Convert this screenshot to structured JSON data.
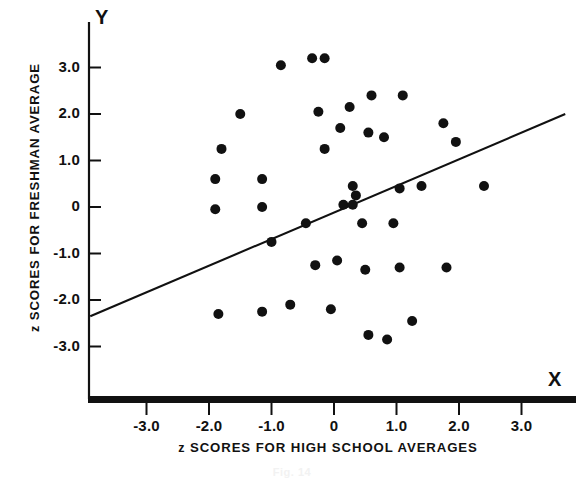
{
  "figure": {
    "caption": "Fig. 14",
    "axis_letters": {
      "y": "Y",
      "x": "X"
    },
    "ink_color": "#111111",
    "background_color": "#ffffff"
  },
  "chart_data": {
    "type": "scatter",
    "title": "",
    "xlabel": "z SCORES FOR HIGH SCHOOL AVERAGES",
    "ylabel": "z SCORES FOR FRESHMAN AVERAGE",
    "xlabel_prefix": "z",
    "xlabel_rest": "SCORES FOR HIGH SCHOOL AVERAGES",
    "ylabel_prefix": "z",
    "ylabel_rest": "SCORES FOR FRESHMAN AVERAGE",
    "grid": false,
    "legend": "none",
    "xlim": [
      -3.95,
      3.85
    ],
    "ylim": [
      -4.0,
      3.75
    ],
    "xticks": [
      -3.0,
      -2.0,
      -1.0,
      0,
      1.0,
      2.0,
      3.0
    ],
    "xtick_labels": [
      "-3.0",
      "-2.0",
      "-1.0",
      "0",
      "1.0",
      "2.0",
      "3.0"
    ],
    "yticks": [
      3.0,
      2.0,
      1.0,
      0,
      -1.0,
      -2.0,
      -3.0
    ],
    "ytick_labels": [
      "3.0",
      "2.0",
      "1.0",
      "0",
      "-1.0",
      "-2.0",
      "-3.0"
    ],
    "point_marker": "filled-circle",
    "point_radius_px": 5,
    "n_points": 42,
    "points": [
      {
        "x": -0.85,
        "y": 3.05
      },
      {
        "x": -0.35,
        "y": 3.2
      },
      {
        "x": -0.15,
        "y": 3.2
      },
      {
        "x": 0.6,
        "y": 2.4
      },
      {
        "x": 1.1,
        "y": 2.4
      },
      {
        "x": -1.5,
        "y": 2.0
      },
      {
        "x": -0.25,
        "y": 2.05
      },
      {
        "x": 0.25,
        "y": 2.15
      },
      {
        "x": 0.1,
        "y": 1.7
      },
      {
        "x": 0.55,
        "y": 1.6
      },
      {
        "x": 0.8,
        "y": 1.5
      },
      {
        "x": 1.75,
        "y": 1.8
      },
      {
        "x": -1.8,
        "y": 1.25
      },
      {
        "x": -0.15,
        "y": 1.25
      },
      {
        "x": -1.9,
        "y": 0.6
      },
      {
        "x": -1.15,
        "y": 0.6
      },
      {
        "x": 0.3,
        "y": 0.45
      },
      {
        "x": 1.05,
        "y": 0.4
      },
      {
        "x": 1.4,
        "y": 0.45
      },
      {
        "x": 2.4,
        "y": 0.45
      },
      {
        "x": -1.9,
        "y": -0.05
      },
      {
        "x": -1.15,
        "y": 0.0
      },
      {
        "x": 0.15,
        "y": 0.05
      },
      {
        "x": 0.3,
        "y": 0.05
      },
      {
        "x": -0.45,
        "y": -0.35
      },
      {
        "x": 0.45,
        "y": -0.35
      },
      {
        "x": 0.95,
        "y": -0.35
      },
      {
        "x": -1.0,
        "y": -0.75
      },
      {
        "x": -0.3,
        "y": -1.25
      },
      {
        "x": 0.05,
        "y": -1.15
      },
      {
        "x": 0.5,
        "y": -1.35
      },
      {
        "x": 1.05,
        "y": -1.3
      },
      {
        "x": 1.8,
        "y": -1.3
      },
      {
        "x": -1.15,
        "y": -2.25
      },
      {
        "x": -0.7,
        "y": -2.1
      },
      {
        "x": -0.05,
        "y": -2.2
      },
      {
        "x": -1.85,
        "y": -2.3
      },
      {
        "x": 1.25,
        "y": -2.45
      },
      {
        "x": 0.55,
        "y": -2.75
      },
      {
        "x": 0.85,
        "y": -2.85
      },
      {
        "x": 1.95,
        "y": 1.4
      },
      {
        "x": 0.35,
        "y": 0.25
      }
    ],
    "regression_line": {
      "label": "regression line",
      "x1": -3.9,
      "y1": -2.35,
      "x2": 3.7,
      "y2": 2.0
    }
  }
}
